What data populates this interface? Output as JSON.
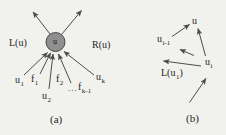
{
  "figure": {
    "colors": {
      "background": "#f1f1ee",
      "ink": "#262626",
      "line": "#4c4c4c",
      "node_fill": "#8f8f8f",
      "node_stroke": "#474747"
    },
    "panel_a": {
      "caption": "(a)",
      "node": {
        "base": "u"
      },
      "left_region_label": "L(u)",
      "right_region_label": "R(u)",
      "labels": [
        {
          "base": "u",
          "sub": "1"
        },
        {
          "base": "f",
          "sub": "1"
        },
        {
          "base": "u",
          "sub": "2"
        },
        {
          "base": "f",
          "sub": "2"
        },
        {
          "base": "...",
          "sub": ""
        },
        {
          "base": "f",
          "sub": "k-1"
        },
        {
          "base": "u",
          "sub": "k"
        }
      ]
    },
    "panel_b": {
      "caption": "(b)",
      "labels": [
        {
          "base": "u",
          "sub": ""
        },
        {
          "base": "u",
          "sub": "i-1"
        },
        {
          "base": "u",
          "sub": "i"
        }
      ],
      "set_label": {
        "prefix": "L(u",
        "sub": "1",
        "suffix": ")"
      }
    }
  }
}
